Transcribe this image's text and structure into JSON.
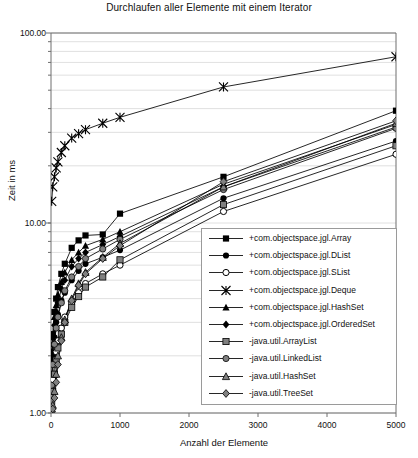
{
  "chart_data": {
    "type": "line",
    "title": "Durchlaufen aller Elemente mit einem Iterator",
    "xlabel": "Anzahl der Elemente",
    "ylabel": "Zeit in ms",
    "yscale": "log",
    "ylim": [
      1.0,
      100.0
    ],
    "xlim": [
      0,
      5000
    ],
    "ytick_labels": [
      "100.00",
      "10.00",
      "1.00"
    ],
    "ytick_values": [
      100.0,
      10.0,
      1.0
    ],
    "xtick_labels": [
      "0",
      "1000",
      "2000",
      "3000",
      "4000",
      "5000"
    ],
    "xtick_values": [
      0,
      1000,
      2000,
      3000,
      4000,
      5000
    ],
    "grid": "horizontal-minor-log",
    "legend_position": "inside-lower-right",
    "x": [
      10,
      25,
      50,
      75,
      100,
      150,
      200,
      300,
      400,
      500,
      750,
      1000,
      2500,
      5000
    ],
    "series": [
      {
        "name": "+com.objectspace.jgl.Array",
        "marker": "filled-square",
        "color": "#000000",
        "values": [
          2.1,
          2.6,
          3.4,
          4.0,
          4.6,
          5.4,
          6.1,
          7.4,
          8.1,
          8.6,
          8.7,
          11.2,
          17.5,
          39.0
        ]
      },
      {
        "name": "+com.objectspace.jgl.DList",
        "marker": "filled-circle",
        "color": "#000000",
        "values": [
          1.6,
          2.0,
          2.5,
          3.0,
          3.3,
          3.9,
          4.3,
          5.0,
          5.6,
          6.1,
          6.6,
          7.2,
          13.5,
          27.0
        ]
      },
      {
        "name": "+com.objectspace.jgl.SLi"
      },
      {
        "name": "+com.objectspace.jgl.SList",
        "marker": "open-circle",
        "color": "#000000",
        "values": [
          1.3,
          1.5,
          1.8,
          2.1,
          2.4,
          2.8,
          3.2,
          3.8,
          4.3,
          4.8,
          5.4,
          6.0,
          11.5,
          23.0
        ]
      },
      {
        "name": "+com.objectspace.jgl.Deque",
        "marker": "star",
        "color": "#000000",
        "values": [
          13.0,
          15.5,
          17.5,
          19.5,
          21.0,
          23.5,
          25.5,
          28.0,
          29.5,
          31.0,
          33.5,
          36.0,
          52.0,
          75.0
        ]
      },
      {
        "name": "+com.objectspace.jgl.HashSet",
        "marker": "filled-triangle",
        "color": "#000000",
        "values": [
          2.0,
          2.5,
          3.2,
          3.7,
          4.2,
          4.9,
          5.5,
          6.4,
          7.0,
          7.6,
          8.2,
          9.0,
          16.0,
          33.0
        ]
      },
      {
        "name": "+com.objectspace.jgl.OrderedSet",
        "marker": "filled-diamond",
        "color": "#000000",
        "values": [
          1.9,
          2.3,
          2.9,
          3.4,
          3.8,
          4.5,
          5.0,
          5.9,
          6.5,
          7.0,
          7.7,
          8.5,
          15.5,
          32.0
        ]
      },
      {
        "name": "-java.util.ArrayList",
        "marker": "gray-square",
        "color": "#808080",
        "values": [
          1.15,
          1.3,
          1.6,
          1.9,
          2.2,
          2.6,
          3.0,
          3.6,
          4.1,
          4.6,
          5.2,
          6.4,
          12.5,
          25.5
        ]
      },
      {
        "name": "-java.util.LinkedList",
        "marker": "gray-circle",
        "color": "#808080",
        "values": [
          1.4,
          1.8,
          2.3,
          2.8,
          3.2,
          3.8,
          4.4,
          5.2,
          5.9,
          6.5,
          7.3,
          8.2,
          15.0,
          31.5
        ]
      },
      {
        "name": "-java.util.HashSet",
        "marker": "gray-triangle",
        "color": "#808080",
        "values": [
          1.05,
          1.1,
          1.3,
          1.6,
          2.0,
          2.5,
          3.1,
          4.0,
          4.8,
          5.5,
          6.6,
          7.8,
          15.5,
          33.5
        ]
      },
      {
        "name": "-java.util.TreeSet",
        "marker": "gray-diamond",
        "color": "#808080",
        "values": [
          1.02,
          1.05,
          1.2,
          1.45,
          1.8,
          2.4,
          3.0,
          3.9,
          4.7,
          5.4,
          6.5,
          7.6,
          16.5,
          34.5
        ]
      }
    ]
  },
  "legend": {
    "items": [
      {
        "label": "+com.objectspace.jgl.Array",
        "marker": "filled-square"
      },
      {
        "label": "+com.objectspace.jgl.DList",
        "marker": "filled-circle"
      },
      {
        "label": "+com.objectspace.jgl.SList",
        "marker": "open-circle"
      },
      {
        "label": "+com.objectspace.jgl.Deque",
        "marker": "star"
      },
      {
        "label": "+com.objectspace.jgl.HashSet",
        "marker": "filled-triangle"
      },
      {
        "label": "+com.objectspace.jgl.OrderedSet",
        "marker": "filled-diamond"
      },
      {
        "label": "-java.util.ArrayList",
        "marker": "gray-square"
      },
      {
        "label": "-java.util.LinkedList",
        "marker": "gray-circle"
      },
      {
        "label": "-java.util.HashSet",
        "marker": "gray-triangle"
      },
      {
        "label": "-java.util.TreeSet",
        "marker": "gray-diamond"
      }
    ]
  },
  "colors": {
    "axis": "#6f6f6f",
    "grid": "#d8d8d8",
    "ink": "#000000",
    "gray_marker": "#808080",
    "background": "#ffffff"
  }
}
